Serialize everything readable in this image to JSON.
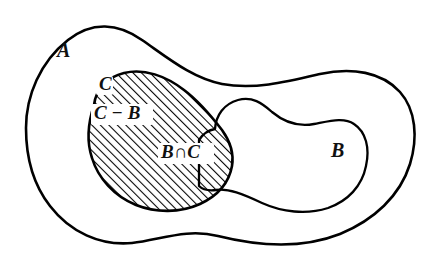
{
  "diagram": {
    "type": "venn-set-diagram",
    "background_color": "#ffffff",
    "stroke_color": "#000000",
    "hatch_color": "#000000",
    "hatch_angle_deg": 45,
    "labels": {
      "a": "A",
      "b": "B",
      "c": "C",
      "c_minus_b": "C − B",
      "b_intersect_c": "B∩C"
    },
    "regions": [
      {
        "name": "A",
        "label": "A",
        "shaded": false,
        "description": "outermost blob containing B and C"
      },
      {
        "name": "B",
        "label": "B",
        "shaded": false,
        "description": "right-hand peanut shaped blob inside A"
      },
      {
        "name": "C",
        "label": "C",
        "shaded": true,
        "description": "left-hand rounded blob inside A, fully hatched"
      },
      {
        "name": "C-B",
        "label": "C − B",
        "shaded": true,
        "description": "part of C outside B, hatched"
      },
      {
        "name": "B-and-C",
        "label": "B∩C",
        "shaded": true,
        "description": "lens overlap of B and C, hatched"
      }
    ]
  }
}
